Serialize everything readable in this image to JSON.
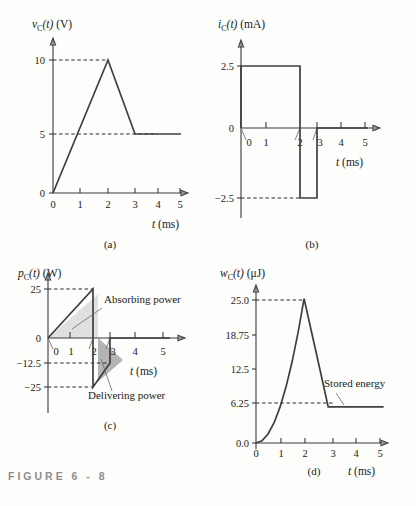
{
  "figure": {
    "caption_prefix": "FIGURE",
    "caption_number": "6 - 8"
  },
  "panels": {
    "a": {
      "caption": "(a)",
      "ylabel_var": "v",
      "ylabel_sub": "C",
      "ylabel_arg": "(t)",
      "ylabel_unit": "(V)",
      "xlabel_var": "t",
      "xlabel_unit": "(ms)",
      "yticks": [
        "0",
        "5",
        "10"
      ],
      "xticks": [
        "0",
        "1",
        "2",
        "3",
        "4",
        "5"
      ]
    },
    "b": {
      "caption": "(b)",
      "ylabel_var": "i",
      "ylabel_sub": "C",
      "ylabel_arg": "(t)",
      "ylabel_unit": "(mA)",
      "xlabel_var": "t",
      "xlabel_unit": "(ms)",
      "yticks": [
        "2.5",
        "0",
        "−2.5"
      ],
      "xticks": [
        "0",
        "1",
        "2",
        "3",
        "4",
        "5"
      ]
    },
    "c": {
      "caption": "(c)",
      "ylabel_var": "p",
      "ylabel_sub": "C",
      "ylabel_arg": "(t)",
      "ylabel_unit": "(W)",
      "xlabel_var": "t",
      "xlabel_unit": "(ms)",
      "yticks": [
        "25",
        "0",
        "−12.5",
        "−25"
      ],
      "xticks": [
        "0",
        "1",
        "2",
        "3",
        "4",
        "5"
      ],
      "annotation_absorbing": "Absorbing power",
      "annotation_delivering": "Delivering power",
      "fill_absorbing": "#e0e0e0",
      "fill_delivering": "#b4b4b4"
    },
    "d": {
      "caption": "(d)",
      "ylabel_var": "w",
      "ylabel_sub": "C",
      "ylabel_arg": "(t)",
      "ylabel_unit": "(μJ)",
      "xlabel_var": "t",
      "xlabel_unit": "(ms)",
      "yticks": [
        "0.0",
        "6.25",
        "12.5",
        "18.75",
        "25.0"
      ],
      "xticks": [
        "0",
        "1",
        "2",
        "3",
        "4",
        "5"
      ],
      "annotation_stored": "Stored energy"
    }
  },
  "chart_data": [
    {
      "type": "line",
      "panel": "a",
      "title": "Capacitor voltage",
      "xlabel": "t (ms)",
      "ylabel": "v_C(t) (V)",
      "xlim": [
        0,
        5.4
      ],
      "ylim": [
        0,
        11
      ],
      "xticks": [
        0,
        1,
        2,
        3,
        4,
        5
      ],
      "yticks": [
        0,
        5,
        10
      ],
      "grid": false,
      "reference_lines": [
        {
          "y": 10,
          "style": "dashed",
          "from_x": 0,
          "to_x": 2
        },
        {
          "y": 5,
          "style": "dashed",
          "from_x": 0,
          "to_x": 3
        }
      ],
      "series": [
        {
          "name": "v_C(t)",
          "x": [
            0,
            2,
            3,
            5.3
          ],
          "y": [
            0,
            10,
            5,
            5
          ]
        }
      ]
    },
    {
      "type": "line",
      "panel": "b",
      "title": "Capacitor current",
      "xlabel": "t (ms)",
      "ylabel": "i_C(t) (mA)",
      "xlim": [
        0,
        5.4
      ],
      "ylim": [
        -3.4,
        3.2
      ],
      "xticks": [
        0,
        1,
        2,
        3,
        4,
        5
      ],
      "yticks": [
        -2.5,
        0,
        2.5
      ],
      "grid": false,
      "reference_lines": [
        {
          "y": -2.5,
          "style": "dashed",
          "from_x": 0,
          "to_x": 2
        }
      ],
      "series": [
        {
          "name": "i_C(t)",
          "x": [
            0,
            0,
            2,
            2,
            3,
            3,
            5.3
          ],
          "y": [
            0,
            2.5,
            2.5,
            -2.5,
            -2.5,
            0,
            0
          ]
        }
      ]
    },
    {
      "type": "area",
      "panel": "c",
      "title": "Capacitor power",
      "xlabel": "t (ms)",
      "ylabel": "p_C(t) (W)",
      "xlim": [
        0,
        5.4
      ],
      "ylim": [
        -28,
        28
      ],
      "xticks": [
        0,
        1,
        2,
        3,
        4,
        5
      ],
      "yticks": [
        -25,
        -12.5,
        0,
        25
      ],
      "grid": false,
      "reference_lines": [
        {
          "y": 25,
          "style": "dashed",
          "from_x": 0,
          "to_x": 2
        },
        {
          "y": -12.5,
          "style": "dashed",
          "from_x": 0,
          "to_x": 3
        },
        {
          "y": -25,
          "style": "dashed",
          "from_x": 0,
          "to_x": 2
        }
      ],
      "series": [
        {
          "name": "p_C(t)",
          "x": [
            0,
            2,
            2,
            3,
            3,
            5.3
          ],
          "y": [
            0,
            25,
            -25,
            -12.5,
            0,
            0
          ]
        }
      ],
      "regions": [
        {
          "label": "Absorbing power",
          "x": [
            0,
            2,
            2
          ],
          "y": [
            0,
            25,
            0
          ],
          "fill": "#e0e0e0"
        },
        {
          "label": "Delivering power",
          "x": [
            2,
            2,
            3
          ],
          "y": [
            0,
            -25,
            -12.5
          ],
          "fill": "#b4b4b4"
        }
      ]
    },
    {
      "type": "line",
      "panel": "d",
      "title": "Stored energy",
      "xlabel": "t (ms)",
      "ylabel": "w_C(t) (μJ)",
      "xlim": [
        0,
        5.4
      ],
      "ylim": [
        0,
        27
      ],
      "xticks": [
        0,
        1,
        2,
        3,
        4,
        5
      ],
      "yticks": [
        0.0,
        6.25,
        12.5,
        18.75,
        25.0
      ],
      "grid": false,
      "reference_lines": [
        {
          "y": 25.0,
          "style": "dashed",
          "from_x": 0,
          "to_x": 2
        },
        {
          "y": 6.25,
          "style": "dashed",
          "from_x": 0,
          "to_x": 3
        }
      ],
      "annotations": [
        {
          "text": "Stored energy",
          "x": 3.4,
          "y": 6.25
        }
      ],
      "series": [
        {
          "name": "w_C(t)",
          "x": [
            0,
            0.25,
            0.5,
            0.75,
            1,
            1.25,
            1.5,
            1.75,
            2,
            2.25,
            2.5,
            2.75,
            3,
            5.3
          ],
          "y": [
            0,
            0.39,
            1.56,
            3.52,
            6.25,
            9.77,
            14.06,
            19.14,
            25.0,
            20.25,
            15.63,
            10.94,
            6.25,
            6.25
          ]
        }
      ]
    }
  ]
}
